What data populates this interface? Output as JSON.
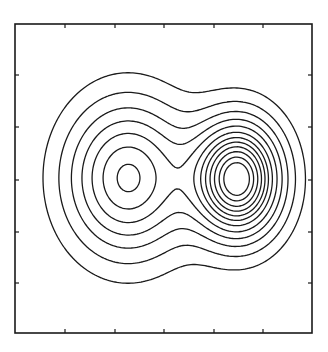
{
  "chart_data": {
    "type": "contour",
    "title": "",
    "xlabel": "",
    "ylabel": "",
    "grid": false,
    "legend": null,
    "tick_labels_visible": false,
    "frame_px": {
      "x0": 15,
      "y0": 24,
      "x1": 312,
      "y1": 333
    },
    "x_ticks_px": [
      65,
      115,
      164,
      214,
      263
    ],
    "y_ticks_px": [
      75,
      127,
      180,
      232,
      283
    ],
    "tick_length_px": 4,
    "peaks": [
      {
        "name": "left-peak",
        "cx_px": 128,
        "cy_px": 178,
        "sx_px": 42,
        "sy_px": 52,
        "amplitude": 0.62
      },
      {
        "name": "right-peak",
        "cx_px": 238,
        "cy_px": 179,
        "sx_px": 30,
        "sy_px": 40,
        "amplitude": 1.0
      }
    ],
    "contour_levels": [
      0.08,
      0.16,
      0.25,
      0.34,
      0.43,
      0.52,
      0.6,
      0.67,
      0.74,
      0.81,
      0.88,
      0.94
    ]
  },
  "colors": {
    "line": "#1a1a1a",
    "background": "#ffffff"
  }
}
